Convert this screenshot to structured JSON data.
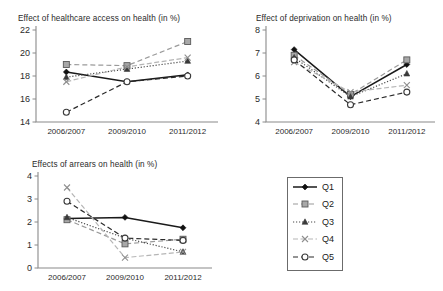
{
  "figure": {
    "background": "#ffffff",
    "axis_color": "#8a8a8a"
  },
  "legend": {
    "name": "series-legend",
    "items": [
      {
        "label": "Q1",
        "marker": "diamond",
        "dash": "solid",
        "color": "#1a1a1a",
        "line_color": "#1a1a1a"
      },
      {
        "label": "Q2",
        "marker": "square",
        "dash": "dashed",
        "color": "#9a9a9a",
        "line_color": "#9a9a9a"
      },
      {
        "label": "Q3",
        "marker": "triangle",
        "dash": "dotted",
        "color": "#4a4a4a",
        "line_color": "#4a4a4a"
      },
      {
        "label": "Q4",
        "marker": "cross",
        "dash": "dashdot",
        "color": "#b5b5b5",
        "line_color": "#b5b5b5"
      },
      {
        "label": "Q5",
        "marker": "circle",
        "dash": "dashed",
        "color": "#555555",
        "line_color": "#2a2a2a"
      }
    ]
  },
  "chart_data": [
    {
      "id": "healthcare-access",
      "type": "line",
      "title": "Effect of healthcare access on health (in %)",
      "xlabel": "",
      "ylabel": "",
      "categories": [
        "2006/2007",
        "2009/2010",
        "2011/2012"
      ],
      "yticks": [
        14,
        16,
        18,
        20,
        22
      ],
      "ylim": [
        14,
        22
      ],
      "grid": false,
      "legend_position": "external",
      "series": [
        {
          "name": "Q1",
          "values": [
            18.35,
            17.5,
            18.1
          ]
        },
        {
          "name": "Q2",
          "values": [
            19.0,
            18.9,
            21.0
          ]
        },
        {
          "name": "Q3",
          "values": [
            17.9,
            18.6,
            19.3
          ]
        },
        {
          "name": "Q4",
          "values": [
            17.5,
            18.8,
            19.6
          ]
        },
        {
          "name": "Q5",
          "values": [
            14.85,
            17.5,
            18.0
          ]
        }
      ]
    },
    {
      "id": "deprivation",
      "type": "line",
      "title": "Effect of deprivation on health (in %)",
      "xlabel": "",
      "ylabel": "",
      "categories": [
        "2006/2007",
        "2009/2010",
        "2011/2012"
      ],
      "yticks": [
        4,
        5,
        6,
        7,
        8
      ],
      "ylim": [
        4,
        8
      ],
      "grid": false,
      "legend_position": "external",
      "series": [
        {
          "name": "Q1",
          "values": [
            7.15,
            5.1,
            6.5
          ]
        },
        {
          "name": "Q2",
          "values": [
            6.9,
            5.2,
            6.7
          ]
        },
        {
          "name": "Q3",
          "values": [
            6.8,
            5.1,
            6.1
          ]
        },
        {
          "name": "Q4",
          "values": [
            6.6,
            5.3,
            5.6
          ]
        },
        {
          "name": "Q5",
          "values": [
            6.7,
            4.75,
            5.3
          ]
        }
      ]
    },
    {
      "id": "arrears",
      "type": "line",
      "title": "Effects of arrears on health (in %)",
      "xlabel": "",
      "ylabel": "",
      "categories": [
        "2006/2007",
        "2009/2010",
        "2011/2012"
      ],
      "yticks": [
        0,
        1,
        2,
        3,
        4
      ],
      "ylim": [
        0,
        4
      ],
      "grid": false,
      "legend_position": "external",
      "series": [
        {
          "name": "Q1",
          "values": [
            2.15,
            2.2,
            1.75
          ]
        },
        {
          "name": "Q2",
          "values": [
            2.1,
            1.05,
            1.25
          ]
        },
        {
          "name": "Q3",
          "values": [
            2.2,
            1.3,
            0.7
          ]
        },
        {
          "name": "Q4",
          "values": [
            3.5,
            0.45,
            0.7
          ]
        },
        {
          "name": "Q5",
          "values": [
            2.9,
            1.3,
            1.2
          ]
        }
      ]
    }
  ]
}
